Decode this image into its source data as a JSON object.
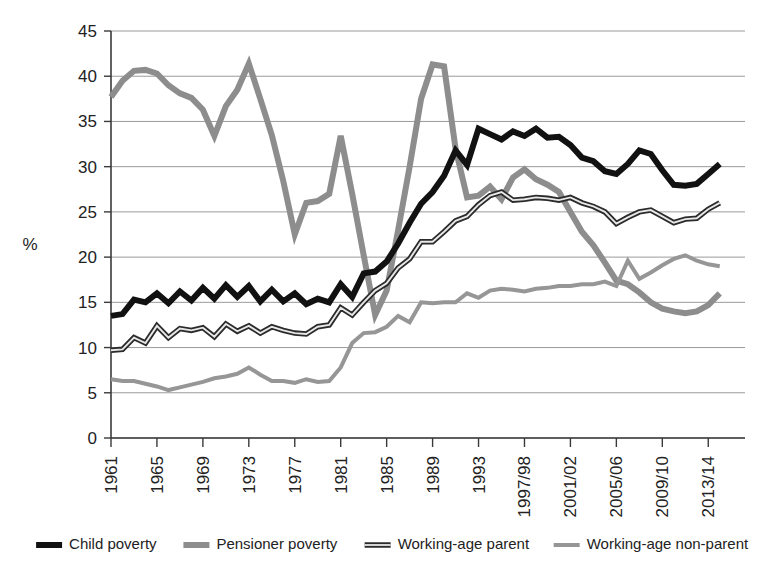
{
  "chart_data": {
    "type": "line",
    "title": "",
    "subtitle": "",
    "xlabel": "",
    "ylabel": "%",
    "ylim": [
      0,
      45
    ],
    "ytick_step": 5,
    "yticks": [
      "0",
      "5",
      "10",
      "15",
      "20",
      "25",
      "30",
      "35",
      "40",
      "45"
    ],
    "grid": true,
    "legend_position": "bottom",
    "xtick_labels": [
      "1961",
      "1965",
      "1969",
      "1973",
      "1977",
      "1981",
      "1985",
      "1989",
      "1993",
      "1997/98",
      "2001/02",
      "2005/06",
      "2009/10",
      "2013/14"
    ],
    "x": [
      1961,
      1962,
      1963,
      1964,
      1965,
      1966,
      1967,
      1968,
      1969,
      1970,
      1971,
      1972,
      1973,
      1974,
      1975,
      1976,
      1977,
      1978,
      1979,
      1980,
      1981,
      1982,
      1983,
      1984,
      1985,
      1986,
      1987,
      1988,
      1989,
      1990,
      1991,
      1992,
      1993,
      1994,
      1995,
      1996,
      1997,
      1998,
      1999,
      2000,
      2001,
      2002,
      2003,
      2004,
      2005,
      2006,
      2007,
      2008,
      2009,
      2010,
      2011,
      2012,
      2013,
      2014
    ],
    "series": [
      {
        "name": "Child poverty",
        "color": "#111111",
        "width": 6,
        "style": "solid-thick",
        "values": [
          13.5,
          13.7,
          15.3,
          15.0,
          16.0,
          14.9,
          16.2,
          15.2,
          16.6,
          15.4,
          16.9,
          15.6,
          16.8,
          15.1,
          16.4,
          15.1,
          16.0,
          14.8,
          15.4,
          15.0,
          17.0,
          15.6,
          18.2,
          18.4,
          19.5,
          21.5,
          23.8,
          25.9,
          27.2,
          29.0,
          31.8,
          30.2,
          34.2,
          33.6,
          33.0,
          33.9,
          33.4,
          34.2,
          33.2,
          33.3,
          32.4,
          31.0,
          30.6,
          29.5,
          29.2,
          30.3,
          31.8,
          31.4,
          29.6,
          28.0,
          27.9,
          28.1,
          29.2,
          30.3
        ]
      },
      {
        "name": "Pensioner poverty",
        "color": "#8d8d8d",
        "width": 6,
        "style": "solid-thick",
        "values": [
          37.7,
          39.5,
          40.6,
          40.7,
          40.3,
          39.0,
          38.1,
          37.6,
          36.3,
          33.4,
          36.7,
          38.5,
          41.4,
          37.5,
          33.5,
          28.4,
          22.5,
          26.0,
          26.2,
          27.0,
          33.4,
          27.0,
          20.2,
          13.6,
          16.3,
          23.0,
          30.0,
          37.5,
          41.3,
          41.1,
          32.0,
          26.6,
          26.8,
          27.8,
          26.4,
          28.8,
          29.7,
          28.6,
          28.0,
          27.2,
          25.0,
          22.8,
          21.3,
          19.4,
          17.4,
          17.0,
          16.1,
          15.0,
          14.3,
          14.0,
          13.8,
          14.0,
          14.7,
          16.0
        ]
      },
      {
        "name": "Working-age parent",
        "color": "#2b2b2b",
        "width": 5.5,
        "style": "outlined",
        "values": [
          9.7,
          9.8,
          11.1,
          10.5,
          12.4,
          11.1,
          12.1,
          11.9,
          12.2,
          11.2,
          12.6,
          11.8,
          12.4,
          11.6,
          12.3,
          11.9,
          11.6,
          11.5,
          12.3,
          12.5,
          14.4,
          13.6,
          15.0,
          16.3,
          17.1,
          18.8,
          19.8,
          21.7,
          21.7,
          22.8,
          24.0,
          24.5,
          25.8,
          26.8,
          27.2,
          26.3,
          26.4,
          26.6,
          26.5,
          26.3,
          26.6,
          26.0,
          25.6,
          25.0,
          23.7,
          24.4,
          25.0,
          25.2,
          24.5,
          23.8,
          24.2,
          24.3,
          25.3,
          26.0
        ]
      },
      {
        "name": "Working-age non-parent",
        "color": "#969696",
        "width": 4,
        "style": "solid-thin",
        "values": [
          6.5,
          6.3,
          6.3,
          6.0,
          5.7,
          5.3,
          5.6,
          5.9,
          6.2,
          6.6,
          6.8,
          7.1,
          7.8,
          7.0,
          6.3,
          6.3,
          6.1,
          6.5,
          6.2,
          6.3,
          7.8,
          10.5,
          11.6,
          11.7,
          12.3,
          13.5,
          12.8,
          15.0,
          14.9,
          15.0,
          15.0,
          16.0,
          15.5,
          16.3,
          16.5,
          16.4,
          16.2,
          16.5,
          16.6,
          16.8,
          16.8,
          17.0,
          17.0,
          17.3,
          16.8,
          19.6,
          17.6,
          18.3,
          19.1,
          19.8,
          20.2,
          19.6,
          19.2,
          19.0
        ]
      }
    ]
  },
  "legend": {
    "items": [
      {
        "label": "Child poverty",
        "color": "#111111",
        "style": "solid-thick"
      },
      {
        "label": "Pensioner poverty",
        "color": "#8d8d8d",
        "style": "solid-thick"
      },
      {
        "label": "Working-age parent",
        "color": "#2b2b2b",
        "style": "outlined"
      },
      {
        "label": "Working-age non-parent",
        "color": "#969696",
        "style": "solid-thin"
      }
    ]
  }
}
